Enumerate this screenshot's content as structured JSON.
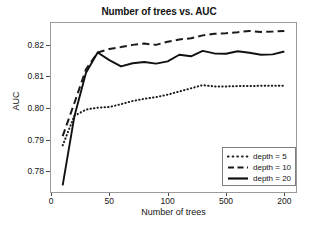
{
  "chart_data": {
    "type": "line",
    "title": "Number of trees vs. AUC",
    "xlabel": "Number of trees",
    "ylabel": "AUC",
    "xlim": [
      0,
      210
    ],
    "ylim": [
      0.7735,
      0.8268
    ],
    "grid": false,
    "legend_position": "lower right",
    "xticks": [
      {
        "value": 0,
        "label": "0"
      },
      {
        "value": 50,
        "label": "50"
      },
      {
        "value": 100,
        "label": "100"
      },
      {
        "value": 150,
        "label": "500"
      },
      {
        "value": 200,
        "label": "200"
      }
    ],
    "yticks": [
      {
        "value": 0.78,
        "label": "0.78"
      },
      {
        "value": 0.79,
        "label": "0.79"
      },
      {
        "value": 0.8,
        "label": "0.80"
      },
      {
        "value": 0.81,
        "label": "0.81"
      },
      {
        "value": 0.82,
        "label": "0.82"
      }
    ],
    "x": [
      10,
      20,
      30,
      40,
      50,
      60,
      70,
      80,
      90,
      100,
      110,
      120,
      130,
      140,
      150,
      160,
      170,
      180,
      190,
      200
    ],
    "series": [
      {
        "name": "depth = 5",
        "label": "depth = 5",
        "style": "dotted",
        "color": "#1a1a1a",
        "values": [
          0.7882,
          0.7975,
          0.7995,
          0.8001,
          0.8003,
          0.8012,
          0.8022,
          0.8029,
          0.8034,
          0.8042,
          0.8052,
          0.8062,
          0.8072,
          0.8068,
          0.8068,
          0.8069,
          0.8069,
          0.807,
          0.807,
          0.807
        ]
      },
      {
        "name": "depth = 10",
        "label": "depth = 10",
        "style": "dashed",
        "color": "#1a1a1a",
        "values": [
          0.7911,
          0.8015,
          0.8122,
          0.8175,
          0.8186,
          0.8192,
          0.8199,
          0.8203,
          0.8199,
          0.8209,
          0.8216,
          0.822,
          0.8229,
          0.8234,
          0.8236,
          0.8239,
          0.8243,
          0.824,
          0.8241,
          0.8243
        ]
      },
      {
        "name": "depth = 20",
        "label": "depth = 20",
        "style": "solid",
        "color": "#111111",
        "values": [
          0.7756,
          0.7973,
          0.8111,
          0.8175,
          0.8151,
          0.8131,
          0.8141,
          0.8145,
          0.814,
          0.8147,
          0.8168,
          0.8163,
          0.818,
          0.8172,
          0.8171,
          0.8179,
          0.8174,
          0.8168,
          0.8169,
          0.8178
        ]
      }
    ]
  }
}
